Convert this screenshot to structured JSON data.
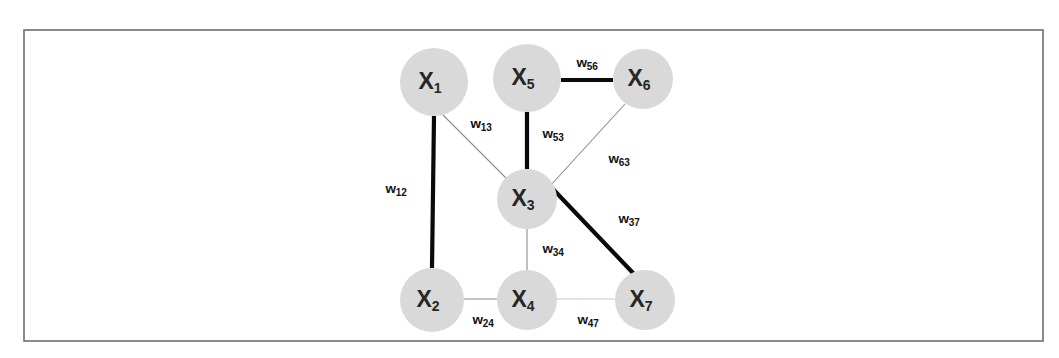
{
  "figure": {
    "background_color": "#ffffff",
    "frame": {
      "x": 24,
      "y": 30,
      "width": 1019,
      "height": 311,
      "stroke_color": "#6e6e6e"
    },
    "node_fill_color": "#d9d9d9",
    "node_text_color": "#262626",
    "edge_thick_color": "#0a0a0a",
    "edge_thin_color": "#8c8c8c",
    "edge_faint_color": "#bfbfbf"
  },
  "chart_data": {
    "type": "diagram",
    "title": "",
    "graph_kind": "undirected weighted graph",
    "nodes": [
      {
        "id": "X1",
        "symbol": "X",
        "subscript": "1",
        "cx": 434,
        "cy": 82,
        "r": 34
      },
      {
        "id": "X5",
        "symbol": "X",
        "subscript": "5",
        "cx": 527,
        "cy": 78,
        "r": 34
      },
      {
        "id": "X6",
        "symbol": "X",
        "subscript": "6",
        "cx": 643,
        "cy": 79,
        "r": 30
      },
      {
        "id": "X3",
        "symbol": "X",
        "subscript": "3",
        "cx": 527,
        "cy": 199,
        "r": 30
      },
      {
        "id": "X2",
        "symbol": "X",
        "subscript": "2",
        "cx": 432,
        "cy": 300,
        "r": 32
      },
      {
        "id": "X4",
        "symbol": "X",
        "subscript": "4",
        "cx": 527,
        "cy": 300,
        "r": 30
      },
      {
        "id": "X7",
        "symbol": "X",
        "subscript": "7",
        "cx": 645,
        "cy": 300,
        "r": 30
      }
    ],
    "edges": [
      {
        "id": "w12",
        "symbol": "w",
        "subscript": "12",
        "source": "X1",
        "target": "X2",
        "x1": 434,
        "y1": 116,
        "x2": 432,
        "y2": 268,
        "weight_class": "thick",
        "label_x": 396,
        "label_y": 189
      },
      {
        "id": "w13",
        "symbol": "w",
        "subscript": "13",
        "source": "X1",
        "target": "X3",
        "x1": 443,
        "y1": 115,
        "x2": 508,
        "y2": 180,
        "weight_class": "thin",
        "label_x": 481,
        "label_y": 124
      },
      {
        "id": "w56",
        "symbol": "w",
        "subscript": "56",
        "source": "X5",
        "target": "X6",
        "x1": 561,
        "y1": 80,
        "x2": 613,
        "y2": 80,
        "weight_class": "thick",
        "label_x": 587,
        "label_y": 63
      },
      {
        "id": "w53",
        "symbol": "w",
        "subscript": "53",
        "source": "X5",
        "target": "X3",
        "x1": 527,
        "y1": 112,
        "x2": 527,
        "y2": 169,
        "weight_class": "thick",
        "label_x": 553,
        "label_y": 134
      },
      {
        "id": "w63",
        "symbol": "w",
        "subscript": "63",
        "source": "X6",
        "target": "X3",
        "x1": 625,
        "y1": 104,
        "x2": 550,
        "y2": 186,
        "weight_class": "thin",
        "label_x": 619,
        "label_y": 159
      },
      {
        "id": "w37",
        "symbol": "w",
        "subscript": "37",
        "source": "X3",
        "target": "X7",
        "x1": 550,
        "y1": 186,
        "x2": 634,
        "y2": 274,
        "weight_class": "thick",
        "label_x": 629,
        "label_y": 219
      },
      {
        "id": "w34",
        "symbol": "w",
        "subscript": "34",
        "source": "X3",
        "target": "X4",
        "x1": 527,
        "y1": 229,
        "x2": 527,
        "y2": 270,
        "weight_class": "thin",
        "label_x": 553,
        "label_y": 249
      },
      {
        "id": "w24",
        "symbol": "w",
        "subscript": "24",
        "source": "X2",
        "target": "X4",
        "x1": 464,
        "y1": 299,
        "x2": 497,
        "y2": 299,
        "weight_class": "thin",
        "label_x": 483,
        "label_y": 320
      },
      {
        "id": "w47",
        "symbol": "w",
        "subscript": "47",
        "source": "X4",
        "target": "X7",
        "x1": 557,
        "y1": 299,
        "x2": 615,
        "y2": 299,
        "weight_class": "faint",
        "label_x": 588,
        "label_y": 320
      }
    ]
  }
}
